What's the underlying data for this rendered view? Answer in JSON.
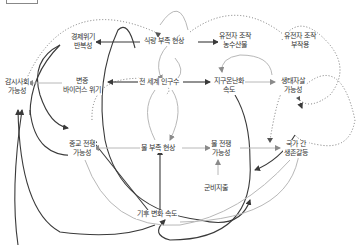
{
  "diagram": {
    "type": "causal-loop-diagram",
    "nodes": {
      "food_shortage": "식량 부족 현상",
      "gmo_crops_l1": "유전자 조작",
      "gmo_crops_l2": "농수산물",
      "gmo_side_l1": "유전자 조작",
      "gmo_side_l2": "부작용",
      "econ_crisis_l1": "경제위기",
      "econ_crisis_l2": "반복성",
      "surveillance_l1": "감시사회",
      "surveillance_l2": "가능성",
      "virus_l1": "변종",
      "virus_l2": "바이러스 위기",
      "world_pop": "전 세계 인구수",
      "warming_l1": "지구온난화",
      "warming_l2": "속도",
      "eco_suicide_l1": "생태자살",
      "eco_suicide_l2": "가능성",
      "religious_war_l1": "종교 전쟁",
      "religious_war_l2": "가능성",
      "water_shortage": "물 부족 현상",
      "water_war_l1": "물 전쟁",
      "water_war_l2": "가능성",
      "national_conflict_l1": "국가 간",
      "national_conflict_l2": "생존갈등",
      "military_spending": "군비지출",
      "climate_change_speed": "기후 변화 속도"
    },
    "colors": {
      "solid": "#3a3a3a",
      "light": "#b8b8b8",
      "dotted": "#777777",
      "text": "#333333"
    }
  }
}
